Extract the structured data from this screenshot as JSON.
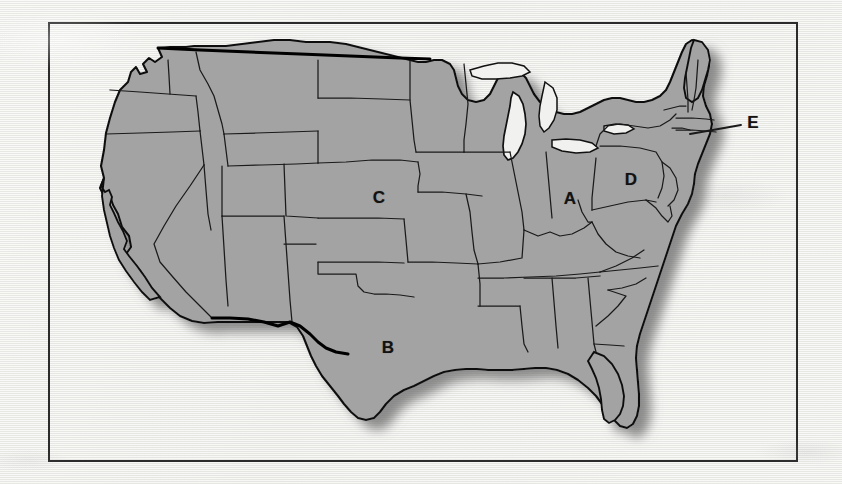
{
  "figure": {
    "kind": "map",
    "title": "",
    "caption": "",
    "region": "Contiguous United States",
    "frame": {
      "x": 48,
      "y": 22,
      "width": 750,
      "height": 440,
      "border_color": "#2b2b2b"
    }
  },
  "colors": {
    "paper": "#f1f1ef",
    "frame_border": "#2b2b2b",
    "land_fill": "#a3a3a3",
    "state_border": "#1a1a1a",
    "national_border": "#000000",
    "water": "#f1f1ef",
    "drop_shadow": "#8d8d8d",
    "label_text": "#121212",
    "leader_line": "#1a1a1a"
  },
  "map": {
    "water_bodies": [
      {
        "name": "Lake Michigan"
      },
      {
        "name": "Lake Superior"
      },
      {
        "name": "Lake Huron"
      },
      {
        "name": "Lake Erie"
      },
      {
        "name": "Lake Ontario"
      },
      {
        "name": "Gulf of Mexico"
      },
      {
        "name": "Atlantic Ocean"
      },
      {
        "name": "Pacific Ocean"
      }
    ],
    "labels": [
      {
        "id": "A",
        "text": "A",
        "state": "Ohio",
        "x": 570,
        "y": 198,
        "has_leader": false
      },
      {
        "id": "B",
        "text": "B",
        "state": "Texas",
        "x": 388,
        "y": 347,
        "has_leader": false
      },
      {
        "id": "C",
        "text": "C",
        "state": "Nebraska",
        "x": 379,
        "y": 197,
        "has_leader": false
      },
      {
        "id": "D",
        "text": "D",
        "state": "Pennsylvania",
        "x": 631,
        "y": 179,
        "has_leader": false
      },
      {
        "id": "E",
        "text": "E",
        "state": "Massachusetts",
        "x": 753,
        "y": 122,
        "has_leader": true,
        "leader_from_x": 741,
        "leader_from_y": 125,
        "leader_to_x": 690,
        "leader_to_y": 134
      }
    ]
  }
}
